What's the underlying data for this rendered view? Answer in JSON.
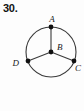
{
  "figure": {
    "problem_number": "30.",
    "caption": "",
    "type": "geometry-diagram",
    "shape": "circle-with-three-radii",
    "stroke_color": "#3a3a3a",
    "point_color": "#101010",
    "background_color": "#fdfdfd",
    "circle": {
      "center_label": "B",
      "center_x": 51,
      "center_y": 52,
      "radius": 25
    },
    "points": [
      {
        "label": "A",
        "role": "on-circle",
        "angle_deg": 90,
        "x": 51,
        "y": 27,
        "label_x": 52,
        "label_y": 22
      },
      {
        "label": "B",
        "role": "center",
        "angle_deg": null,
        "x": 51,
        "y": 52,
        "label_x": 56,
        "label_y": 50
      },
      {
        "label": "C",
        "role": "on-circle",
        "angle_deg": -22,
        "x": 74,
        "y": 61,
        "label_x": 75,
        "label_y": 70
      },
      {
        "label": "D",
        "role": "on-circle",
        "angle_deg": 200,
        "x": 28,
        "y": 61,
        "label_x": 20,
        "label_y": 65
      }
    ],
    "segments": [
      {
        "name": "radius-BA",
        "from": "B",
        "to": "A"
      },
      {
        "name": "radius-BC",
        "from": "B",
        "to": "C"
      },
      {
        "name": "radius-BD",
        "from": "B",
        "to": "D"
      }
    ]
  }
}
